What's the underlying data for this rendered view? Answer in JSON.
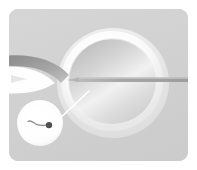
{
  "illustration": {
    "title": "Intracytoplasmic sperm injection",
    "panel_background": "#d2d2d2",
    "page_background": "#ffffff",
    "figure_kind": "medical-illustration",
    "egg": {
      "label": "egg cell",
      "zona_color": "#f7f7f7",
      "halo_color": "#e3e3e3",
      "cytoplasm_color": "#dcdcdc",
      "cytoplasm_highlight": "#fbfbfb",
      "center_x": 104,
      "center_y": 74,
      "outer_radius_x": 56,
      "outer_radius_y": 56,
      "inner_radius_x": 44,
      "inner_radius_y": 43
    },
    "injection_needle": {
      "label": "injection micropipette",
      "color": "#a8a8a8",
      "tip_x": 66,
      "entry_y": 72,
      "origin_x": 179
    },
    "holding_pipette": {
      "label": "holding pipette",
      "color": "#8f8f8f",
      "suction_color": "#ffffff"
    },
    "leader_line": {
      "label": "magnifier leader line",
      "color": "#ffffff",
      "from_x": 48,
      "from_y": 112,
      "to_x": 80,
      "to_y": 82
    },
    "magnifier": {
      "label": "sperm detail inset",
      "fill": "#ffffff",
      "center_x": 31,
      "center_y": 114,
      "radius": 23,
      "sperm": {
        "label": "sperm cell",
        "head_color": "#4a4a4a",
        "tail_color": "#7a7a7a",
        "head_x": 40,
        "head_y": 116,
        "head_radius": 3.2,
        "tail_start_x": 19,
        "tail_start_y": 113
      }
    }
  }
}
